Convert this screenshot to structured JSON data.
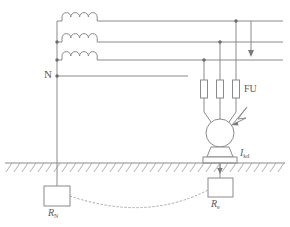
{
  "figure": {
    "type": "electrical-schematic",
    "background_color": "#ffffff",
    "line_color": "#8a8a8a"
  },
  "labels": {
    "neutral": "N",
    "fuse": "FU",
    "fault_current_symbol": "I",
    "fault_current_subscript": "kd",
    "neutral_resistor_symbol": "R",
    "neutral_resistor_subscript": "N",
    "equipment_resistor_symbol": "R",
    "equipment_resistor_subscript": "e"
  },
  "components": {
    "transformer_windings": {
      "name": "three-phase transformer secondary windings",
      "count": 3,
      "arcs_per_winding": 4
    },
    "phase_lines": {
      "name": "three phase conductors",
      "count": 3
    },
    "neutral_line": {
      "name": "neutral conductor"
    },
    "fuses": {
      "name": "fuse bank",
      "label": "FU",
      "count": 3
    },
    "motor": {
      "name": "three-phase motor",
      "leads": 3
    },
    "fault_arrow": {
      "name": "insulation fault indicator"
    },
    "current_arrow": {
      "name": "fault current direction arrow"
    },
    "neutral_ground_resistor": {
      "name": "neutral earthing resistor",
      "label": "R_N"
    },
    "equipment_ground_resistor": {
      "name": "equipment earthing resistor",
      "label": "R_e"
    },
    "earth": {
      "name": "earth ground hatched line"
    },
    "earth_return_path": {
      "name": "dashed earth return current path"
    }
  }
}
